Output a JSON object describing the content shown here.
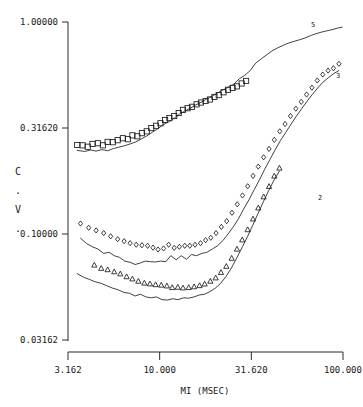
{
  "chart_data": {
    "type": "scatter",
    "title": "",
    "subtitle": "",
    "xlabel": "MI (MSEC)",
    "ylabel": "C.V.",
    "ylabel_chars": [
      "C",
      ".",
      "V",
      "."
    ],
    "xscale": "log",
    "yscale": "log",
    "xlim": [
      3.162,
      100.0
    ],
    "ylim": [
      0.03162,
      1.0
    ],
    "grid": false,
    "legend": "inline-right-end-labels",
    "xticks": [
      "3.162",
      "10.000",
      "31.620",
      "100.000"
    ],
    "xtick_values": [
      3.162,
      10.0,
      31.62,
      100.0
    ],
    "yticks": [
      "1.00000",
      "0.31620",
      "0.10000",
      "0.03162"
    ],
    "ytick_values": [
      1.0,
      0.3162,
      0.1,
      0.03162
    ],
    "series": [
      {
        "name": "5",
        "label": "5",
        "marker": "square",
        "has_fitted_line": true,
        "points": [
          {
            "x": 3.55,
            "y": 0.263
          },
          {
            "x": 3.8,
            "y": 0.262
          },
          {
            "x": 4.05,
            "y": 0.258
          },
          {
            "x": 4.3,
            "y": 0.266
          },
          {
            "x": 4.6,
            "y": 0.268
          },
          {
            "x": 4.9,
            "y": 0.262
          },
          {
            "x": 5.2,
            "y": 0.272
          },
          {
            "x": 5.55,
            "y": 0.271
          },
          {
            "x": 5.9,
            "y": 0.277
          },
          {
            "x": 6.3,
            "y": 0.283
          },
          {
            "x": 6.7,
            "y": 0.28
          },
          {
            "x": 7.1,
            "y": 0.292
          },
          {
            "x": 7.55,
            "y": 0.289
          },
          {
            "x": 8.0,
            "y": 0.299
          },
          {
            "x": 8.5,
            "y": 0.305
          },
          {
            "x": 9.0,
            "y": 0.316
          },
          {
            "x": 9.55,
            "y": 0.324
          },
          {
            "x": 10.1,
            "y": 0.333
          },
          {
            "x": 10.7,
            "y": 0.345
          },
          {
            "x": 11.3,
            "y": 0.352
          },
          {
            "x": 12.0,
            "y": 0.36
          },
          {
            "x": 12.7,
            "y": 0.372
          },
          {
            "x": 13.4,
            "y": 0.385
          },
          {
            "x": 14.2,
            "y": 0.392
          },
          {
            "x": 15.0,
            "y": 0.398
          },
          {
            "x": 15.9,
            "y": 0.409
          },
          {
            "x": 16.8,
            "y": 0.417
          },
          {
            "x": 17.8,
            "y": 0.424
          },
          {
            "x": 18.8,
            "y": 0.431
          },
          {
            "x": 19.9,
            "y": 0.443
          },
          {
            "x": 21.0,
            "y": 0.452
          },
          {
            "x": 22.3,
            "y": 0.466
          },
          {
            "x": 23.6,
            "y": 0.479
          },
          {
            "x": 25.0,
            "y": 0.489
          },
          {
            "x": 26.4,
            "y": 0.497
          },
          {
            "x": 28.0,
            "y": 0.513
          },
          {
            "x": 29.6,
            "y": 0.527
          }
        ],
        "line": [
          {
            "x": 3.55,
            "y": 0.248
          },
          {
            "x": 3.9,
            "y": 0.245
          },
          {
            "x": 4.2,
            "y": 0.249
          },
          {
            "x": 4.5,
            "y": 0.246
          },
          {
            "x": 4.85,
            "y": 0.25
          },
          {
            "x": 5.2,
            "y": 0.247
          },
          {
            "x": 5.6,
            "y": 0.253
          },
          {
            "x": 6.0,
            "y": 0.257
          },
          {
            "x": 6.45,
            "y": 0.261
          },
          {
            "x": 6.9,
            "y": 0.266
          },
          {
            "x": 7.4,
            "y": 0.272
          },
          {
            "x": 7.95,
            "y": 0.281
          },
          {
            "x": 8.5,
            "y": 0.29
          },
          {
            "x": 9.1,
            "y": 0.302
          },
          {
            "x": 9.75,
            "y": 0.313
          },
          {
            "x": 10.4,
            "y": 0.327
          },
          {
            "x": 11.2,
            "y": 0.338
          },
          {
            "x": 12.0,
            "y": 0.352
          },
          {
            "x": 12.8,
            "y": 0.367
          },
          {
            "x": 13.7,
            "y": 0.38
          },
          {
            "x": 14.7,
            "y": 0.392
          },
          {
            "x": 15.7,
            "y": 0.406
          },
          {
            "x": 16.8,
            "y": 0.418
          },
          {
            "x": 18.0,
            "y": 0.433
          },
          {
            "x": 19.3,
            "y": 0.447
          },
          {
            "x": 20.7,
            "y": 0.462
          },
          {
            "x": 22.1,
            "y": 0.478
          },
          {
            "x": 23.7,
            "y": 0.492
          },
          {
            "x": 25.4,
            "y": 0.51
          },
          {
            "x": 27.2,
            "y": 0.54
          },
          {
            "x": 29.1,
            "y": 0.56
          },
          {
            "x": 31.2,
            "y": 0.59
          },
          {
            "x": 33.4,
            "y": 0.64
          },
          {
            "x": 35.8,
            "y": 0.67
          },
          {
            "x": 38.3,
            "y": 0.7
          },
          {
            "x": 41.0,
            "y": 0.73
          },
          {
            "x": 44.0,
            "y": 0.755
          },
          {
            "x": 47.0,
            "y": 0.775
          },
          {
            "x": 50.4,
            "y": 0.795
          },
          {
            "x": 54.0,
            "y": 0.81
          },
          {
            "x": 58.0,
            "y": 0.825
          },
          {
            "x": 62.0,
            "y": 0.84
          },
          {
            "x": 66.5,
            "y": 0.862
          },
          {
            "x": 71.0,
            "y": 0.88
          },
          {
            "x": 76.0,
            "y": 0.895
          },
          {
            "x": 81.5,
            "y": 0.908
          },
          {
            "x": 87.0,
            "y": 0.92
          },
          {
            "x": 93.0,
            "y": 0.935
          },
          {
            "x": 99.0,
            "y": 0.945
          }
        ]
      },
      {
        "name": "3",
        "label": "3",
        "marker": "diamond",
        "has_fitted_line": true,
        "points": [
          {
            "x": 3.7,
            "y": 0.112
          },
          {
            "x": 4.1,
            "y": 0.107
          },
          {
            "x": 4.5,
            "y": 0.104
          },
          {
            "x": 4.95,
            "y": 0.101
          },
          {
            "x": 5.4,
            "y": 0.0975
          },
          {
            "x": 5.9,
            "y": 0.0945
          },
          {
            "x": 6.4,
            "y": 0.0925
          },
          {
            "x": 6.9,
            "y": 0.0905
          },
          {
            "x": 7.45,
            "y": 0.089
          },
          {
            "x": 8.0,
            "y": 0.0885
          },
          {
            "x": 8.6,
            "y": 0.088
          },
          {
            "x": 9.2,
            "y": 0.0862
          },
          {
            "x": 9.8,
            "y": 0.0845
          },
          {
            "x": 10.5,
            "y": 0.0855
          },
          {
            "x": 11.2,
            "y": 0.089
          },
          {
            "x": 12.0,
            "y": 0.086
          },
          {
            "x": 12.8,
            "y": 0.087
          },
          {
            "x": 13.7,
            "y": 0.088
          },
          {
            "x": 14.6,
            "y": 0.088
          },
          {
            "x": 15.6,
            "y": 0.089
          },
          {
            "x": 16.7,
            "y": 0.0905
          },
          {
            "x": 17.8,
            "y": 0.0935
          },
          {
            "x": 19.0,
            "y": 0.096
          },
          {
            "x": 20.3,
            "y": 0.101
          },
          {
            "x": 21.7,
            "y": 0.108
          },
          {
            "x": 23.2,
            "y": 0.115
          },
          {
            "x": 24.8,
            "y": 0.126
          },
          {
            "x": 26.5,
            "y": 0.138
          },
          {
            "x": 28.3,
            "y": 0.152
          },
          {
            "x": 30.2,
            "y": 0.168
          },
          {
            "x": 32.3,
            "y": 0.188
          },
          {
            "x": 34.5,
            "y": 0.208
          },
          {
            "x": 36.9,
            "y": 0.23
          },
          {
            "x": 39.5,
            "y": 0.252
          },
          {
            "x": 42.2,
            "y": 0.278
          },
          {
            "x": 45.2,
            "y": 0.305
          },
          {
            "x": 48.3,
            "y": 0.33
          },
          {
            "x": 51.7,
            "y": 0.36
          },
          {
            "x": 55.3,
            "y": 0.39
          },
          {
            "x": 59.2,
            "y": 0.42
          },
          {
            "x": 63.3,
            "y": 0.455
          },
          {
            "x": 67.7,
            "y": 0.49
          },
          {
            "x": 72.4,
            "y": 0.53
          },
          {
            "x": 77.5,
            "y": 0.565
          },
          {
            "x": 82.9,
            "y": 0.59
          },
          {
            "x": 88.7,
            "y": 0.605
          },
          {
            "x": 95.0,
            "y": 0.635
          }
        ],
        "line": [
          {
            "x": 3.7,
            "y": 0.0955
          },
          {
            "x": 4.0,
            "y": 0.09
          },
          {
            "x": 4.3,
            "y": 0.087
          },
          {
            "x": 4.6,
            "y": 0.085
          },
          {
            "x": 4.95,
            "y": 0.081
          },
          {
            "x": 5.3,
            "y": 0.082
          },
          {
            "x": 5.65,
            "y": 0.079
          },
          {
            "x": 6.05,
            "y": 0.0775
          },
          {
            "x": 6.45,
            "y": 0.0745
          },
          {
            "x": 6.9,
            "y": 0.0735
          },
          {
            "x": 7.35,
            "y": 0.0718
          },
          {
            "x": 7.85,
            "y": 0.073
          },
          {
            "x": 8.35,
            "y": 0.0745
          },
          {
            "x": 8.9,
            "y": 0.074
          },
          {
            "x": 9.5,
            "y": 0.0738
          },
          {
            "x": 10.1,
            "y": 0.0745
          },
          {
            "x": 10.8,
            "y": 0.074
          },
          {
            "x": 11.5,
            "y": 0.079
          },
          {
            "x": 12.3,
            "y": 0.0755
          },
          {
            "x": 13.1,
            "y": 0.079
          },
          {
            "x": 14.0,
            "y": 0.076
          },
          {
            "x": 14.9,
            "y": 0.08
          },
          {
            "x": 15.9,
            "y": 0.079
          },
          {
            "x": 17.0,
            "y": 0.081
          },
          {
            "x": 18.1,
            "y": 0.082
          },
          {
            "x": 19.4,
            "y": 0.085
          },
          {
            "x": 20.7,
            "y": 0.088
          },
          {
            "x": 22.1,
            "y": 0.093
          },
          {
            "x": 23.6,
            "y": 0.1
          },
          {
            "x": 25.2,
            "y": 0.108
          },
          {
            "x": 26.9,
            "y": 0.118
          },
          {
            "x": 28.7,
            "y": 0.131
          },
          {
            "x": 30.7,
            "y": 0.145
          },
          {
            "x": 32.8,
            "y": 0.162
          },
          {
            "x": 35.0,
            "y": 0.18
          },
          {
            "x": 37.4,
            "y": 0.202
          },
          {
            "x": 40.0,
            "y": 0.225
          },
          {
            "x": 42.7,
            "y": 0.25
          },
          {
            "x": 45.6,
            "y": 0.276
          },
          {
            "x": 48.8,
            "y": 0.302
          },
          {
            "x": 52.1,
            "y": 0.33
          },
          {
            "x": 55.7,
            "y": 0.36
          },
          {
            "x": 59.5,
            "y": 0.39
          },
          {
            "x": 63.6,
            "y": 0.422
          },
          {
            "x": 68.0,
            "y": 0.455
          },
          {
            "x": 72.7,
            "y": 0.488
          },
          {
            "x": 77.7,
            "y": 0.52
          },
          {
            "x": 83.0,
            "y": 0.545
          },
          {
            "x": 88.7,
            "y": 0.57
          },
          {
            "x": 94.8,
            "y": 0.59
          }
        ]
      },
      {
        "name": "2",
        "label": "2",
        "marker": "triangle",
        "has_fitted_line": true,
        "points": [
          {
            "x": 4.4,
            "y": 0.0715
          },
          {
            "x": 4.8,
            "y": 0.069
          },
          {
            "x": 5.2,
            "y": 0.068
          },
          {
            "x": 5.65,
            "y": 0.0665
          },
          {
            "x": 6.1,
            "y": 0.065
          },
          {
            "x": 6.6,
            "y": 0.063
          },
          {
            "x": 7.1,
            "y": 0.0615
          },
          {
            "x": 7.65,
            "y": 0.06
          },
          {
            "x": 8.25,
            "y": 0.0588
          },
          {
            "x": 8.85,
            "y": 0.0583
          },
          {
            "x": 9.5,
            "y": 0.0578
          },
          {
            "x": 10.2,
            "y": 0.0575
          },
          {
            "x": 10.95,
            "y": 0.057
          },
          {
            "x": 11.7,
            "y": 0.056
          },
          {
            "x": 12.55,
            "y": 0.0562
          },
          {
            "x": 13.4,
            "y": 0.0558
          },
          {
            "x": 14.4,
            "y": 0.056
          },
          {
            "x": 15.4,
            "y": 0.0565
          },
          {
            "x": 16.5,
            "y": 0.0572
          },
          {
            "x": 17.6,
            "y": 0.0582
          },
          {
            "x": 18.9,
            "y": 0.06
          },
          {
            "x": 20.2,
            "y": 0.0622
          },
          {
            "x": 21.6,
            "y": 0.066
          },
          {
            "x": 23.1,
            "y": 0.0705
          },
          {
            "x": 24.7,
            "y": 0.077
          },
          {
            "x": 26.4,
            "y": 0.085
          },
          {
            "x": 28.2,
            "y": 0.094
          },
          {
            "x": 30.2,
            "y": 0.105
          },
          {
            "x": 32.3,
            "y": 0.118
          },
          {
            "x": 34.5,
            "y": 0.133
          },
          {
            "x": 36.9,
            "y": 0.15
          },
          {
            "x": 39.5,
            "y": 0.168
          },
          {
            "x": 42.2,
            "y": 0.188
          },
          {
            "x": 45.0,
            "y": 0.205
          }
        ],
        "line": [
          {
            "x": 3.55,
            "y": 0.065
          },
          {
            "x": 3.85,
            "y": 0.0625
          },
          {
            "x": 4.15,
            "y": 0.061
          },
          {
            "x": 4.45,
            "y": 0.0595
          },
          {
            "x": 4.8,
            "y": 0.0585
          },
          {
            "x": 5.15,
            "y": 0.057
          },
          {
            "x": 5.55,
            "y": 0.0555
          },
          {
            "x": 5.95,
            "y": 0.0545
          },
          {
            "x": 6.4,
            "y": 0.053
          },
          {
            "x": 6.85,
            "y": 0.0525
          },
          {
            "x": 7.35,
            "y": 0.051
          },
          {
            "x": 7.85,
            "y": 0.052
          },
          {
            "x": 8.4,
            "y": 0.0505
          },
          {
            "x": 9.0,
            "y": 0.05
          },
          {
            "x": 9.6,
            "y": 0.0505
          },
          {
            "x": 10.3,
            "y": 0.049
          },
          {
            "x": 11.0,
            "y": 0.0488
          },
          {
            "x": 11.8,
            "y": 0.0495
          },
          {
            "x": 12.6,
            "y": 0.049
          },
          {
            "x": 13.5,
            "y": 0.05
          },
          {
            "x": 14.4,
            "y": 0.0498
          },
          {
            "x": 15.4,
            "y": 0.0505
          },
          {
            "x": 16.4,
            "y": 0.0515
          },
          {
            "x": 17.6,
            "y": 0.052
          },
          {
            "x": 18.8,
            "y": 0.0535
          },
          {
            "x": 20.1,
            "y": 0.0555
          },
          {
            "x": 21.5,
            "y": 0.0585
          },
          {
            "x": 23.0,
            "y": 0.063
          },
          {
            "x": 24.6,
            "y": 0.069
          },
          {
            "x": 26.3,
            "y": 0.077
          },
          {
            "x": 28.1,
            "y": 0.086
          },
          {
            "x": 30.1,
            "y": 0.097
          },
          {
            "x": 32.2,
            "y": 0.11
          },
          {
            "x": 34.4,
            "y": 0.125
          },
          {
            "x": 36.8,
            "y": 0.142
          },
          {
            "x": 39.3,
            "y": 0.16
          },
          {
            "x": 42.1,
            "y": 0.18
          },
          {
            "x": 45.0,
            "y": 0.198
          }
        ]
      }
    ]
  }
}
